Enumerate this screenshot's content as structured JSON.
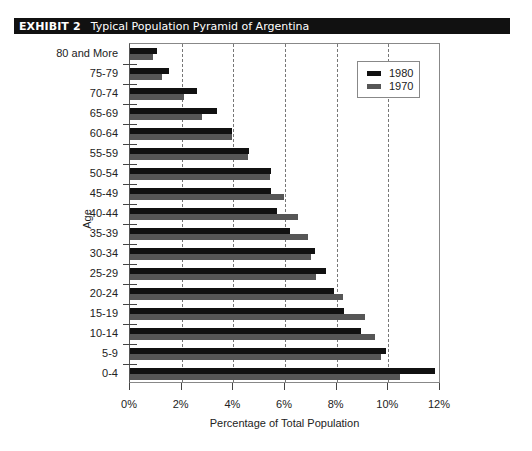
{
  "header": {
    "exhibit_label": "EXHIBIT 2",
    "title": "Typical Population Pyramid of Argentina"
  },
  "colors": {
    "series_1980": "#111111",
    "series_1970": "#565656",
    "grid": "#777777",
    "title_bar": "#111111"
  },
  "legend": {
    "items": [
      {
        "label": "1980",
        "color": "#111111"
      },
      {
        "label": "1970",
        "color": "#565656"
      }
    ]
  },
  "chart_data": {
    "type": "bar",
    "orientation": "horizontal",
    "title": "Typical Population Pyramid of Argentina",
    "xlabel": "Percentage of Total Population",
    "ylabel": "Age",
    "xlim": [
      0,
      12
    ],
    "xticks": [
      "0%",
      "2%",
      "4%",
      "6%",
      "8%",
      "10%",
      "12%"
    ],
    "grid": "vertical dashed at 2% intervals",
    "legend_position": "top-right inside plot",
    "categories": [
      "80 and More",
      "75-79",
      "70-74",
      "65-69",
      "60-64",
      "55-59",
      "50-54",
      "45-49",
      "40-44",
      "35-39",
      "30-34",
      "25-29",
      "20-24",
      "15-19",
      "10-14",
      "5-9",
      "0-4"
    ],
    "series": [
      {
        "name": "1980",
        "values": [
          1.05,
          1.5,
          2.6,
          3.35,
          3.95,
          4.6,
          5.45,
          5.45,
          5.7,
          6.2,
          7.15,
          7.6,
          7.9,
          8.3,
          8.95,
          9.9,
          11.8
        ]
      },
      {
        "name": "1970",
        "values": [
          0.9,
          1.25,
          2.1,
          2.8,
          3.95,
          4.55,
          5.4,
          5.95,
          6.5,
          6.9,
          7.0,
          7.2,
          8.25,
          9.1,
          9.5,
          9.7,
          10.45
        ]
      }
    ]
  }
}
